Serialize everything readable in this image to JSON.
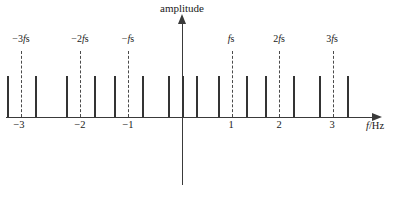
{
  "figure": {
    "title_y": "amplitude",
    "xlabel": "f/Hz",
    "xlabel_italic": "f",
    "xlabel_rest": "/Hz"
  },
  "axes": {
    "y_axis_name": "amplitude-axis",
    "x_axis_name": "frequency-axis",
    "x_origin_px": 182,
    "px_per_unit": 50
  },
  "tick_labels": [
    {
      "text": "−3",
      "value": -3,
      "x": 19
    },
    {
      "text": "−2",
      "value": -2,
      "x": 80
    },
    {
      "text": "−1",
      "value": -1,
      "x": 128
    },
    {
      "text": "1",
      "value": 1,
      "x": 231
    },
    {
      "text": "2",
      "value": 2,
      "x": 279
    },
    {
      "text": "3",
      "value": 3,
      "x": 332
    }
  ],
  "harmonic_labels": [
    {
      "text": "−3fs",
      "prefix": "−3",
      "italic": "f",
      "suffix": "s",
      "x": 21
    },
    {
      "text": "−2fs",
      "prefix": "−2",
      "italic": "f",
      "suffix": "s",
      "x": 80
    },
    {
      "text": "−fs",
      "prefix": "−",
      "italic": "f",
      "suffix": "s",
      "x": 128
    },
    {
      "text": "fs",
      "prefix": "",
      "italic": "f",
      "suffix": "s",
      "x": 231
    },
    {
      "text": "2fs",
      "prefix": "2",
      "italic": "f",
      "suffix": "s",
      "x": 279
    },
    {
      "text": "3fs",
      "prefix": "3",
      "italic": "f",
      "suffix": "s",
      "x": 332
    }
  ],
  "chart_data": {
    "type": "bar",
    "title": "amplitude",
    "xlabel": "f/Hz",
    "ylabel": "amplitude",
    "xlim": [
      -3.6,
      3.9
    ],
    "ylim": [
      0,
      1.05
    ],
    "grid": false,
    "legend": null,
    "carriers": {
      "name": "sampling harmonics (dashed)",
      "style": "dashed",
      "x_values": [
        -3,
        -2,
        -1,
        0,
        1,
        2,
        3
      ],
      "x_pixels": [
        21,
        80,
        128,
        182,
        232,
        279,
        333
      ],
      "height": 1.0
    },
    "series": [
      {
        "name": "spectral lines",
        "style": "solid",
        "x_pixels": [
          7,
          35,
          66,
          94,
          114,
          142,
          168,
          196,
          218,
          246,
          265,
          293,
          319,
          347
        ],
        "heights": [
          0.78,
          0.78,
          0.78,
          0.78,
          0.78,
          0.78,
          0.78,
          0.78,
          0.78,
          0.78,
          0.78,
          0.78,
          0.78,
          0.78
        ],
        "values": [
          0.78,
          0.78,
          0.78,
          0.78,
          0.78,
          0.78,
          0.78,
          0.78,
          0.78,
          0.78,
          0.78,
          0.78,
          0.78,
          0.78
        ]
      },
      {
        "name": "baseband line",
        "style": "solid",
        "x_pixels": [
          182
        ],
        "heights": [
          0.78
        ],
        "values": [
          0.78
        ]
      }
    ]
  }
}
